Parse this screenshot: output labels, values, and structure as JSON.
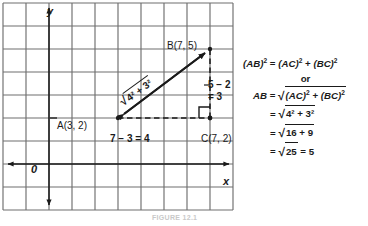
{
  "figure": {
    "caption": "FIGURE 12.1",
    "axes": {
      "x_label": "x",
      "y_label": "y",
      "origin_label": "0"
    },
    "points": {
      "a": {
        "name": "A",
        "coords": "(3, 2)",
        "label": "A(3, 2)",
        "x": 3,
        "y": 2
      },
      "b": {
        "name": "B",
        "coords": "(7, 5)",
        "label": "B(7, 5)",
        "x": 7,
        "y": 5
      },
      "c": {
        "name": "C",
        "coords": "(7, 2)",
        "label": "C(7, 2)",
        "x": 7,
        "y": 2
      }
    },
    "legs": {
      "horizontal_label": "7 − 3 = 4",
      "vertical_label_line1": "5 − 2",
      "vertical_label_line2": "= 3",
      "hypotenuse_radicand": "4² + 3²"
    },
    "right_angle_at": "C",
    "grid": {
      "columns": 10,
      "rows": 9,
      "cell_px": 23
    }
  },
  "equations": {
    "line1": "(AB)² = (AC)² + (BC)²",
    "or": "or",
    "line2": "AB = √(AC)² + (BC)²",
    "line3": "= √4² + 3²",
    "line4": "= √16 + 9",
    "line5": "= √25 = 5",
    "parts": {
      "ab_sq": "(AB)",
      "ac_sq": "(AC)",
      "bc_sq": "(BC)",
      "ab": "AB",
      "eq": "=",
      "plus": "+",
      "exp2": "2",
      "rad_sign": "√",
      "radicand_3": "4² + 3²",
      "radicand_4": "16 + 9",
      "radicand_5": "25",
      "result": "5"
    }
  },
  "colors": {
    "ink": "#1a1a1a",
    "grid": "#6e6e6e",
    "background": "#ffffff",
    "caption": "#c9c9c9"
  }
}
